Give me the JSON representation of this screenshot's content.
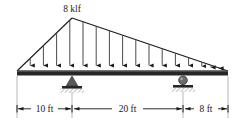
{
  "figure": {
    "type": "beam-loading-diagram",
    "title_label": "",
    "load": {
      "label": "8 klf",
      "magnitude": 8,
      "unit": "klf",
      "distribution": "triangular",
      "peak_position_label": "at left support",
      "arrow_count": 17
    },
    "beam": {
      "color": "#262626",
      "left_end_label": "",
      "right_end_label": ""
    },
    "supports": [
      {
        "name": "pin-support",
        "type": "pin",
        "position_label": "10 ft from left end"
      },
      {
        "name": "roller-support",
        "type": "roller",
        "position_label": "30 ft from left end"
      }
    ],
    "dimensions": [
      {
        "label": "10 ft",
        "value": 10,
        "unit": "ft"
      },
      {
        "label": "20 ft",
        "value": 20,
        "unit": "ft"
      },
      {
        "label": "8 ft",
        "value": 8,
        "unit": "ft"
      }
    ],
    "colors": {
      "line": "#1a1a1a",
      "beam": "#262626",
      "support": "#4d4d4d",
      "hatch": "#808080",
      "dimension": "#1a1a1a",
      "background": "#ffffff"
    }
  }
}
